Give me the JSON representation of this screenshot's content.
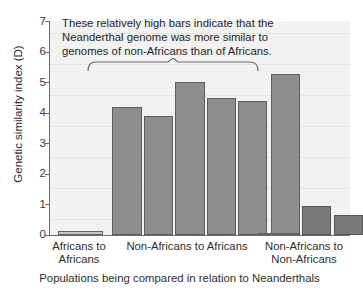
{
  "chart_data": {
    "type": "bar",
    "title": "",
    "xlabel": "Populations being compared in relation to Neanderthals",
    "ylabel": "Genetic similarity index (D)",
    "ylim": [
      0,
      7
    ],
    "yticks": [
      0,
      1,
      2,
      3,
      4,
      5,
      6,
      7
    ],
    "grid": false,
    "legend": "none",
    "group_labels": [
      "Africans to Africans",
      "Non-Africans to Africans",
      "Non-Africans to Non-Africans"
    ],
    "group_label_lines": [
      [
        "Africans to",
        "Africans"
      ],
      [
        "Non-Africans to Africans"
      ],
      [
        "Non-Africans to",
        "Non-Africans"
      ]
    ],
    "categories": [
      "1",
      "2",
      "3",
      "4",
      "5",
      "6",
      "7",
      "8",
      "9",
      "10"
    ],
    "values": [
      0.12,
      4.19,
      3.88,
      5.0,
      4.47,
      4.37,
      5.26,
      0.08,
      0.96,
      0.64
    ],
    "bars": [
      {
        "name": "bar-1",
        "group": "Africans to Africans",
        "value": 0.12,
        "shade": "tiny"
      },
      {
        "name": "bar-2",
        "group": "Non-Africans to Africans",
        "value": 4.19,
        "shade": "light"
      },
      {
        "name": "bar-3",
        "group": "Non-Africans to Africans",
        "value": 3.88,
        "shade": "light"
      },
      {
        "name": "bar-4",
        "group": "Non-Africans to Africans",
        "value": 5.0,
        "shade": "light"
      },
      {
        "name": "bar-5",
        "group": "Non-Africans to Africans",
        "value": 4.47,
        "shade": "light"
      },
      {
        "name": "bar-6",
        "group": "Non-Africans to Africans",
        "value": 4.37,
        "shade": "light"
      },
      {
        "name": "bar-7",
        "group": "Non-Africans to Africans",
        "value": 5.26,
        "shade": "light"
      },
      {
        "name": "bar-8",
        "group": "Non-Africans to Non-Africans",
        "value": 0.08,
        "shade": "tiny"
      },
      {
        "name": "bar-9",
        "group": "Non-Africans to Non-Africans",
        "value": 0.96,
        "shade": "dark"
      },
      {
        "name": "bar-10",
        "group": "Non-Africans to Non-Africans",
        "value": 0.64,
        "shade": "dark"
      }
    ],
    "annotation": {
      "lines": [
        "These relatively high bars indicate that the",
        "Neanderthal genome was more similar to",
        "genomes of non-Africans than of Africans."
      ],
      "points_to": "Non-Africans to Africans"
    },
    "colors": {
      "bar_fill": "#8e8e8e",
      "bar_fill_dark": "#7a7a7a",
      "bar_fill_tiny": "#c9c9c6",
      "bar_stroke": "#5d5d5d",
      "plot_background": "#f2f2f0",
      "axis": "#6b6b6b",
      "text": "#2e2e2e"
    }
  }
}
